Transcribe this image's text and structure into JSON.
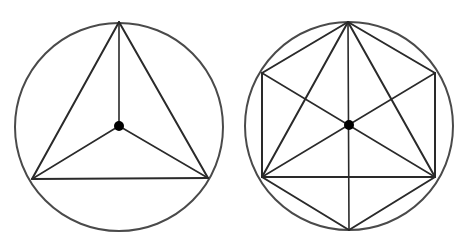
{
  "canvas": {
    "width": 472,
    "height": 237,
    "background": "#ffffff"
  },
  "style": {
    "circle_stroke": "#4a4a4a",
    "circle_width": 2,
    "line_stroke": "#2a2a2a",
    "line_width": 2,
    "spoke_width": 1.6,
    "dot_fill": "#000000",
    "dot_radius": 5
  },
  "figures": [
    {
      "id": "triangle-in-circle",
      "description": "Equilateral triangle inscribed in a circle with spokes from center to each vertex",
      "circle": {
        "cx": 119,
        "cy": 127,
        "r": 104
      },
      "center": {
        "x": 119,
        "y": 126
      },
      "vertices": [
        {
          "x": 119,
          "y": 22
        },
        {
          "x": 32,
          "y": 179
        },
        {
          "x": 208,
          "y": 178
        }
      ],
      "edges": [
        [
          0,
          1
        ],
        [
          1,
          2
        ],
        [
          2,
          0
        ]
      ],
      "spokes": [
        0,
        1,
        2
      ]
    },
    {
      "id": "hexagon-triangle-in-circle",
      "description": "Regular hexagon and equilateral triangle inscribed in a circle, with all long diagonals through the center",
      "circle": {
        "cx": 349,
        "cy": 126,
        "r": 104
      },
      "center": {
        "x": 349,
        "y": 125
      },
      "vertices": [
        {
          "x": 348,
          "y": 22
        },
        {
          "x": 435,
          "y": 73
        },
        {
          "x": 435,
          "y": 177
        },
        {
          "x": 349,
          "y": 230
        },
        {
          "x": 262,
          "y": 177
        },
        {
          "x": 262,
          "y": 73
        }
      ],
      "hexagon_edges": [
        [
          0,
          1
        ],
        [
          1,
          2
        ],
        [
          2,
          3
        ],
        [
          3,
          4
        ],
        [
          4,
          5
        ],
        [
          5,
          0
        ]
      ],
      "triangle_edges": [
        [
          0,
          2
        ],
        [
          2,
          4
        ],
        [
          4,
          0
        ]
      ],
      "diagonals": [
        [
          0,
          3
        ],
        [
          1,
          4
        ],
        [
          5,
          2
        ]
      ]
    }
  ]
}
